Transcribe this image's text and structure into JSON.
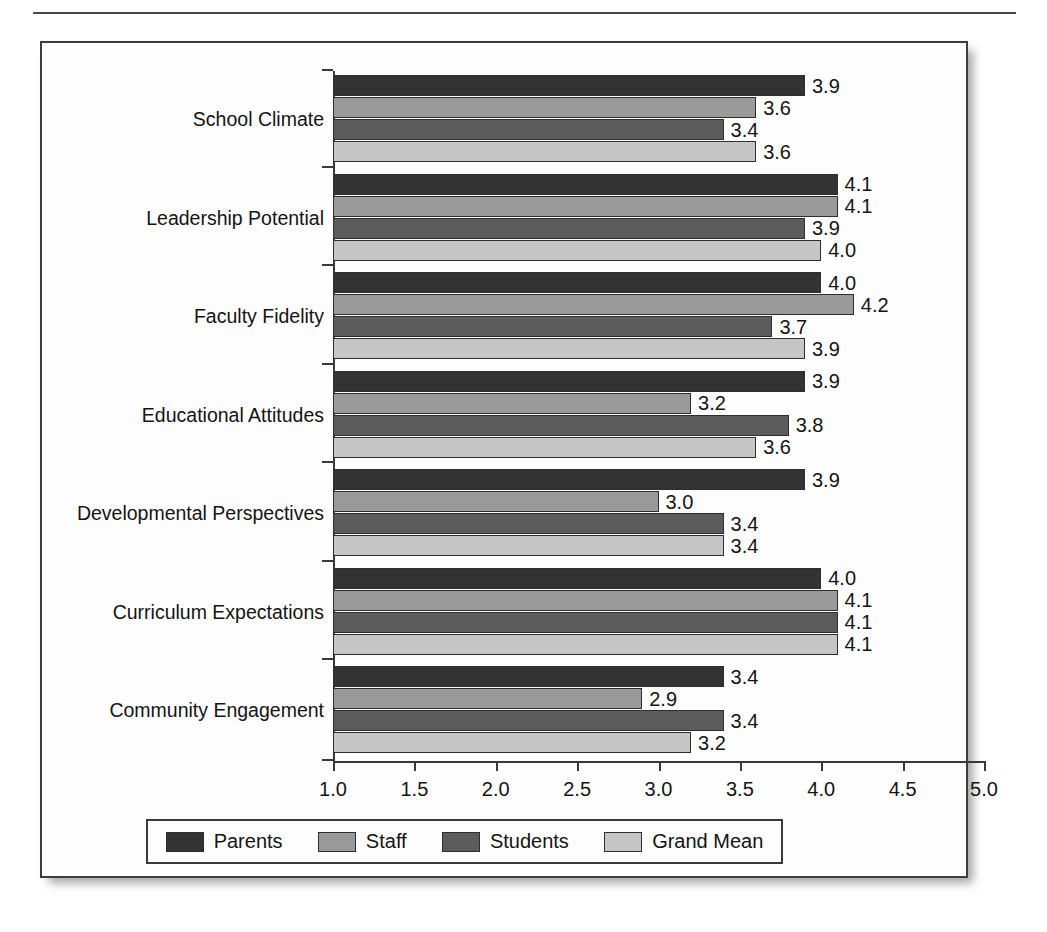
{
  "chart_data": {
    "type": "bar",
    "orientation": "horizontal",
    "title": "",
    "xlabel": "",
    "ylabel": "",
    "xlim": [
      1.0,
      5.0
    ],
    "xticks": [
      "1.0",
      "1.5",
      "2.0",
      "2.5",
      "3.0",
      "3.5",
      "4.0",
      "4.5",
      "5.0"
    ],
    "xtick_values": [
      1.0,
      1.5,
      2.0,
      2.5,
      3.0,
      3.5,
      4.0,
      4.5,
      5.0
    ],
    "grid": false,
    "legend_position": "bottom",
    "categories": [
      "School Climate",
      "Leadership Potential",
      "Faculty Fidelity",
      "Educational Attitudes",
      "Developmental Perspectives",
      "Curriculum Expectations",
      "Community Engagement"
    ],
    "series": [
      {
        "name": "Parents",
        "color": "#333333",
        "values": [
          3.9,
          4.1,
          4.0,
          3.9,
          3.9,
          4.0,
          3.4
        ],
        "labels": [
          "3.9",
          "4.1",
          "4.0",
          "3.9",
          "3.9",
          "4.0",
          "3.4"
        ]
      },
      {
        "name": "Staff",
        "color": "#9a9a9a",
        "values": [
          3.6,
          4.1,
          4.2,
          3.2,
          3.0,
          4.1,
          2.9
        ],
        "labels": [
          "3.6",
          "4.1",
          "4.2",
          "3.2",
          "3.0",
          "4.1",
          "2.9"
        ]
      },
      {
        "name": "Students",
        "color": "#5c5c5c",
        "values": [
          3.4,
          3.9,
          3.7,
          3.8,
          3.4,
          4.1,
          3.4
        ],
        "labels": [
          "3.4",
          "3.9",
          "3.7",
          "3.8",
          "3.4",
          "4.1",
          "3.4"
        ]
      },
      {
        "name": "Grand Mean",
        "color": "#c6c6c6",
        "values": [
          3.6,
          4.0,
          3.9,
          3.6,
          3.4,
          4.1,
          3.2
        ],
        "labels": [
          "3.6",
          "4.0",
          "3.9",
          "3.6",
          "3.4",
          "4.1",
          "3.2"
        ]
      }
    ]
  },
  "legend": {
    "entries": [
      {
        "label": "Parents",
        "color": "#333333"
      },
      {
        "label": "Staff",
        "color": "#9a9a9a"
      },
      {
        "label": "Students",
        "color": "#5c5c5c"
      },
      {
        "label": "Grand Mean",
        "color": "#c6c6c6"
      }
    ]
  }
}
